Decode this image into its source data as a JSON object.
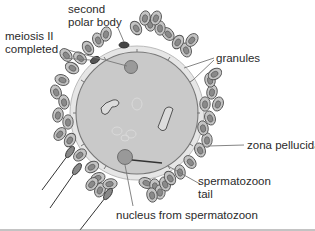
{
  "diagram": {
    "type": "biological illustration: fertilized human egg (ovum) after sperm penetration",
    "labels": {
      "second_polar_body": [
        "second",
        "polar body"
      ],
      "meiosis_completed": [
        "meiosis II",
        "completed"
      ],
      "granules": "granules",
      "zona_pellucida": "zona pellucida",
      "spermatozoon_tail": [
        "spermatozoon",
        "tail"
      ],
      "nucleus_from_spermatozoon": "nucleus from spermatozoon"
    },
    "colors": {
      "cytoplasm": "#c8c8c8",
      "zona": "#e4e4e4",
      "outline": "#7a7a7a",
      "cell_fill": "#bdbdbd",
      "cell_nucleus": "#8a8a8a",
      "nucleus": "#9a9a9a",
      "leader": "#777777"
    }
  }
}
